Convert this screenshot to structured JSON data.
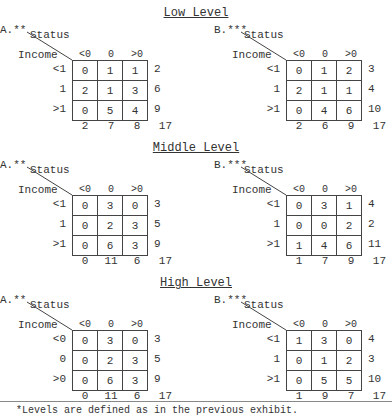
{
  "sections": [
    {
      "title": "Low Level",
      "panels": [
        {
          "label": "A.**",
          "status": "Status",
          "income": "Income",
          "cols": [
            "<0",
            "0",
            ">0"
          ],
          "rows": [
            "<1",
            "1",
            ">1"
          ],
          "cells": [
            [
              "0",
              "1",
              "1"
            ],
            [
              "2",
              "1",
              "3"
            ],
            [
              "0",
              "5",
              "4"
            ]
          ],
          "row_totals": [
            "2",
            "6",
            "9"
          ],
          "col_totals": [
            "2",
            "7",
            "8"
          ],
          "grand_total": "17"
        },
        {
          "label": "B.***",
          "status": "Status",
          "income": "Income",
          "cols": [
            "<0",
            "0",
            ">0"
          ],
          "rows": [
            "<1",
            "1",
            ">1"
          ],
          "cells": [
            [
              "0",
              "1",
              "2"
            ],
            [
              "2",
              "1",
              "1"
            ],
            [
              "0",
              "4",
              "6"
            ]
          ],
          "row_totals": [
            "3",
            "4",
            "10"
          ],
          "col_totals": [
            "2",
            "6",
            "9"
          ],
          "grand_total": "17"
        }
      ]
    },
    {
      "title": "Middle Level",
      "panels": [
        {
          "label": "A.**",
          "status": "Status",
          "income": "Income",
          "cols": [
            "<0",
            "0",
            ">0"
          ],
          "rows": [
            "<1",
            "1",
            ">1"
          ],
          "cells": [
            [
              "0",
              "3",
              "0"
            ],
            [
              "0",
              "2",
              "3"
            ],
            [
              "0",
              "6",
              "3"
            ]
          ],
          "row_totals": [
            "3",
            "5",
            "9"
          ],
          "col_totals": [
            "0",
            "11",
            "6"
          ],
          "grand_total": "17"
        },
        {
          "label": "B.***",
          "status": "Status",
          "income": "Income",
          "cols": [
            "<0",
            "0",
            ">0"
          ],
          "rows": [
            "<1",
            "1",
            ">1"
          ],
          "cells": [
            [
              "0",
              "3",
              "1"
            ],
            [
              "0",
              "0",
              "2"
            ],
            [
              "1",
              "4",
              "6"
            ]
          ],
          "row_totals": [
            "4",
            "2",
            "11"
          ],
          "col_totals": [
            "1",
            "7",
            "9"
          ],
          "grand_total": "17"
        }
      ]
    },
    {
      "title": "High Level",
      "panels": [
        {
          "label": "A.**",
          "status": "Status",
          "income": "Income",
          "cols": [
            "<0",
            "0",
            ">0"
          ],
          "rows": [
            "<0",
            "0",
            ">0"
          ],
          "cells": [
            [
              "0",
              "3",
              "0"
            ],
            [
              "0",
              "2",
              "3"
            ],
            [
              "0",
              "6",
              "3"
            ]
          ],
          "row_totals": [
            "3",
            "5",
            "9"
          ],
          "col_totals": [
            "0",
            "11",
            "6"
          ],
          "grand_total": "17"
        },
        {
          "label": "B.***",
          "status": "Status",
          "income": "Income",
          "cols": [
            "<0",
            "0",
            ">0"
          ],
          "rows": [
            "<1",
            "1",
            ">1"
          ],
          "cells": [
            [
              "1",
              "3",
              "0"
            ],
            [
              "0",
              "1",
              "2"
            ],
            [
              "0",
              "5",
              "5"
            ]
          ],
          "row_totals": [
            "4",
            "3",
            "10"
          ],
          "col_totals": [
            "1",
            "9",
            "7"
          ],
          "grand_total": "17"
        }
      ]
    }
  ],
  "footnote": "*Levels are defined as in the previous exhibit."
}
